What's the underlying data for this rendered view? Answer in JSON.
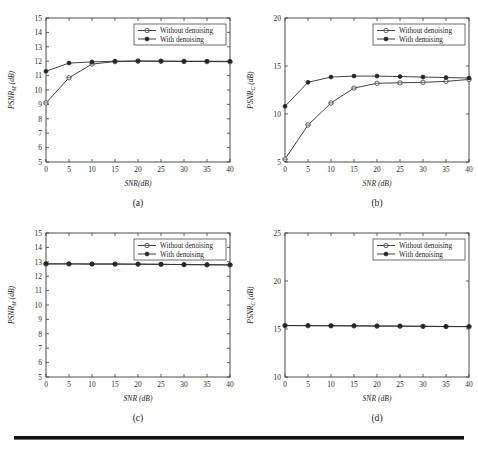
{
  "figure": {
    "background": "#ffffff",
    "rule_color": "#111111",
    "line_color": "#2e2e2e",
    "marker_open_fill": "#ffffff"
  },
  "legend": {
    "without_label": "Without denoising",
    "with_label": "With denoising"
  },
  "chart_data": [
    {
      "type": "line",
      "panel": "a",
      "caption": "(a)",
      "title": "",
      "xlabel": "SNR(dB)",
      "ylabel": "PSNR",
      "ylabel_sub": "M",
      "ylabel_unit": " (dB)",
      "x": [
        0,
        5,
        10,
        15,
        20,
        25,
        30,
        35,
        40
      ],
      "xlim": [
        0,
        40
      ],
      "ylim": [
        5,
        15
      ],
      "xticks": [
        0,
        5,
        10,
        15,
        20,
        25,
        30,
        35,
        40
      ],
      "yticks": [
        5,
        6,
        7,
        8,
        9,
        10,
        11,
        12,
        13,
        14,
        15
      ],
      "grid": false,
      "legend_position": "upper right",
      "series": [
        {
          "name": "Without denoising",
          "marker": "open-circle",
          "values": [
            9.1,
            10.85,
            11.8,
            11.97,
            12.0,
            11.99,
            11.98,
            11.97,
            11.96
          ]
        },
        {
          "name": "With denoising",
          "marker": "filled-circle",
          "values": [
            11.3,
            11.87,
            11.95,
            12.0,
            12.02,
            12.01,
            12.0,
            12.0,
            11.99
          ]
        }
      ]
    },
    {
      "type": "line",
      "panel": "b",
      "caption": "(b)",
      "title": "",
      "xlabel": "SNR (dB)",
      "ylabel": "PSNR",
      "ylabel_sub": "C",
      "ylabel_unit": " (dB)",
      "x": [
        0,
        5,
        10,
        15,
        20,
        25,
        30,
        35,
        40
      ],
      "xlim": [
        0,
        40
      ],
      "ylim": [
        5,
        20
      ],
      "xticks": [
        0,
        5,
        10,
        15,
        20,
        25,
        30,
        35,
        40
      ],
      "yticks": [
        5,
        10,
        15,
        20
      ],
      "grid": false,
      "legend_position": "upper right",
      "series": [
        {
          "name": "Without denoising",
          "marker": "open-circle",
          "values": [
            5.3,
            8.85,
            11.15,
            12.7,
            13.2,
            13.25,
            13.3,
            13.4,
            13.6
          ]
        },
        {
          "name": "With denoising",
          "marker": "filled-circle",
          "values": [
            10.8,
            13.3,
            13.85,
            13.95,
            13.95,
            13.9,
            13.85,
            13.8,
            13.75
          ]
        }
      ]
    },
    {
      "type": "line",
      "panel": "c",
      "caption": "(c)",
      "title": "",
      "xlabel": "SNR (dB)",
      "ylabel": "PSNR",
      "ylabel_sub": "M",
      "ylabel_unit": " (dB)",
      "x": [
        0,
        5,
        10,
        15,
        20,
        25,
        30,
        35,
        40
      ],
      "xlim": [
        0,
        40
      ],
      "ylim": [
        5,
        15
      ],
      "xticks": [
        0,
        5,
        10,
        15,
        20,
        25,
        30,
        35,
        40
      ],
      "yticks": [
        5,
        6,
        7,
        8,
        9,
        10,
        11,
        12,
        13,
        14,
        15
      ],
      "grid": false,
      "legend_position": "upper right",
      "series": [
        {
          "name": "Without denoising",
          "marker": "open-circle",
          "values": [
            12.85,
            12.85,
            12.84,
            12.84,
            12.83,
            12.82,
            12.8,
            12.79,
            12.78
          ]
        },
        {
          "name": "With denoising",
          "marker": "filled-circle",
          "values": [
            12.86,
            12.86,
            12.85,
            12.85,
            12.84,
            12.83,
            12.81,
            12.8,
            12.79
          ]
        }
      ]
    },
    {
      "type": "line",
      "panel": "d",
      "caption": "(d)",
      "title": "",
      "xlabel": "SNR (dB)",
      "ylabel": "PSNR",
      "ylabel_sub": "C",
      "ylabel_unit": " (dB)",
      "x": [
        0,
        5,
        10,
        15,
        20,
        25,
        30,
        35,
        40
      ],
      "xlim": [
        0,
        40
      ],
      "ylim": [
        10,
        25
      ],
      "xticks": [
        0,
        5,
        10,
        15,
        20,
        25,
        30,
        35,
        40
      ],
      "yticks": [
        10,
        15,
        20,
        25
      ],
      "grid": false,
      "legend_position": "upper right",
      "series": [
        {
          "name": "Without denoising",
          "marker": "open-circle",
          "values": [
            15.35,
            15.34,
            15.33,
            15.32,
            15.3,
            15.29,
            15.27,
            15.25,
            15.24
          ]
        },
        {
          "name": "With denoising",
          "marker": "filled-circle",
          "values": [
            15.37,
            15.36,
            15.35,
            15.34,
            15.32,
            15.31,
            15.29,
            15.27,
            15.26
          ]
        }
      ]
    }
  ]
}
